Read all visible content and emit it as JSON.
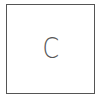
{
  "card": {
    "letter": "C",
    "border_color": "#555555",
    "text_color": "#444444"
  }
}
